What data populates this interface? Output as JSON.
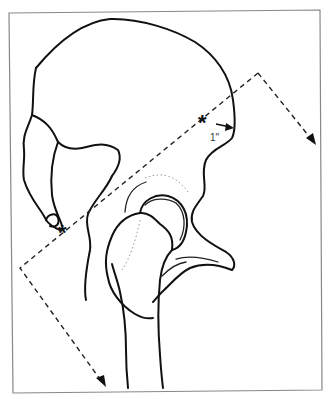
{
  "figure": {
    "landmarks": [
      {
        "symbol": "*",
        "description": "posterior-inferior landmark"
      },
      {
        "symbol": "*",
        "description": "anterior-superior landmark"
      }
    ],
    "measurement_label": "1\"",
    "incision_path": "dashed line with arrowheads"
  }
}
